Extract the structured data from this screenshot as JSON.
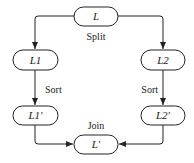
{
  "diagram": {
    "type": "flowchart",
    "title": "",
    "nodes": [
      {
        "id": "L",
        "label": "L"
      },
      {
        "id": "L1",
        "label": "L1"
      },
      {
        "id": "L2",
        "label": "L2"
      },
      {
        "id": "L1p",
        "label": "L1′"
      },
      {
        "id": "L2p",
        "label": "L2′"
      },
      {
        "id": "Lp",
        "label": "L′"
      }
    ],
    "edges": [
      {
        "from": "L",
        "to": "L1",
        "label": ""
      },
      {
        "from": "L",
        "to": "L2",
        "label": ""
      },
      {
        "from": "L1",
        "to": "L1p",
        "label": "Sort"
      },
      {
        "from": "L2",
        "to": "L2p",
        "label": "Sort"
      },
      {
        "from": "L1p",
        "to": "Lp",
        "label": ""
      },
      {
        "from": "L2p",
        "to": "Lp",
        "label": ""
      }
    ],
    "annotations": {
      "split": "Split",
      "sort_left": "Sort",
      "sort_right": "Sort",
      "join": "Join"
    },
    "colors": {
      "stroke": "#222222",
      "background": "#ffffff"
    }
  }
}
